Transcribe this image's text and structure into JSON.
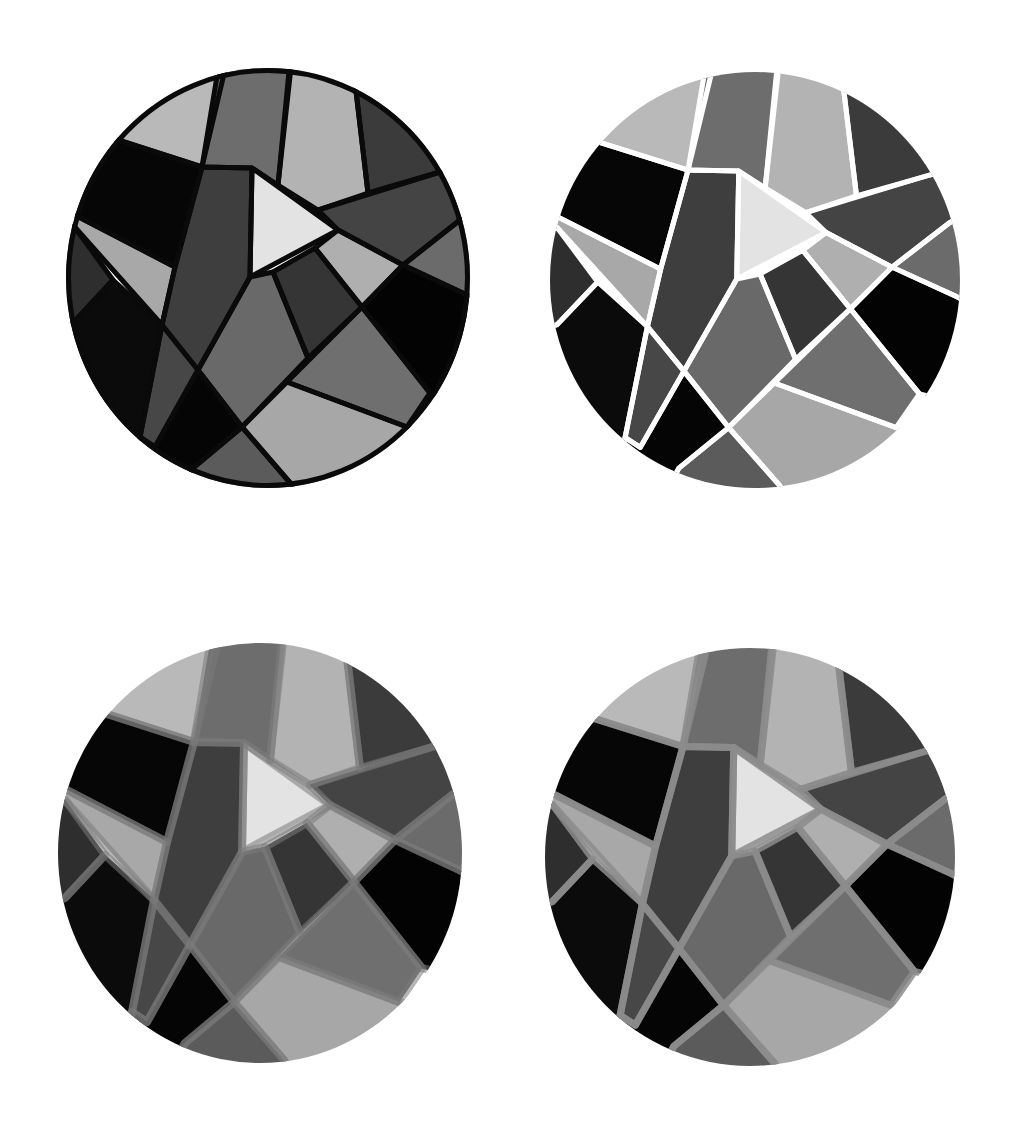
{
  "figure": {
    "source_box": {
      "x": 60,
      "y": 60,
      "w": 420,
      "h": 440
    },
    "clip_ellipse": {
      "cx": 268,
      "cy": 278,
      "rx": 202,
      "ry": 210
    },
    "pieces": [
      {
        "id": "top-left-light",
        "fill": "#b9b9b9",
        "points": "40,40 232,40 202,167 118,140 40,118"
      },
      {
        "id": "top-dark-strip",
        "fill": "#6d6d6d",
        "points": "223,40 294,40 278,185 252,168 202,167"
      },
      {
        "id": "top-light-strip",
        "fill": "#b3b3b3",
        "points": "292,40 350,40 368,193 318,210 278,185"
      },
      {
        "id": "top-right-dark",
        "fill": "#3b3b3b",
        "points": "350,40 500,40 500,155 440,172 368,193"
      },
      {
        "id": "right-dark-band",
        "fill": "#444444",
        "points": "318,210 440,172 500,155 500,195 460,220 403,265 338,230"
      },
      {
        "id": "right-small-medium",
        "fill": "#6b6b6b",
        "points": "460,220 500,195 500,312 467,295 403,265"
      },
      {
        "id": "left-black",
        "fill": "#060606",
        "points": "40,118 118,140 202,167 175,267 75,215 40,200"
      },
      {
        "id": "left-light-stripe",
        "fill": "#a8a8a8",
        "points": "40,200 75,215 175,267 162,325 73,225 40,214"
      },
      {
        "id": "left-very-dark",
        "fill": "#2e2e2e",
        "points": "40,214 73,225 113,280 73,323 40,335"
      },
      {
        "id": "lower-left-black",
        "fill": "#0b0b0b",
        "points": "113,280 162,325 140,437 120,520 40,520 40,335 73,323"
      },
      {
        "id": "central-dark-band",
        "fill": "#3e3e3e",
        "points": "202,167 252,168 250,277 198,370 162,325 175,267"
      },
      {
        "id": "lower-dark-sliver",
        "fill": "#474747",
        "points": "162,325 198,370 155,447 140,437"
      },
      {
        "id": "bottom-black",
        "fill": "#050505",
        "points": "198,370 242,427 193,468 165,520 120,520 140,437 155,447"
      },
      {
        "id": "bottom-medium",
        "fill": "#5b5b5b",
        "points": "242,427 292,485 310,520 165,520 193,468"
      },
      {
        "id": "center-medium",
        "fill": "#696969",
        "points": "250,277 273,272 308,358 242,427 198,370"
      },
      {
        "id": "center-dark",
        "fill": "#353535",
        "points": "273,272 315,248 362,307 308,358"
      },
      {
        "id": "right-light-small",
        "fill": "#afafaf",
        "points": "315,248 338,230 403,265 362,307"
      },
      {
        "id": "right-black",
        "fill": "#030303",
        "points": "362,307 403,265 467,295 500,312 500,410 430,393"
      },
      {
        "id": "lower-right-medium",
        "fill": "#6f6f6f",
        "points": "287,382 362,307 430,393 407,427"
      },
      {
        "id": "bottom-light",
        "fill": "#a7a7a7",
        "points": "242,427 287,382 407,427 500,450 500,520 310,520 292,485"
      },
      {
        "id": "play-triangle",
        "fill": "#e3e3e3",
        "points": "252,168 338,230 250,277"
      }
    ]
  },
  "variants": [
    {
      "name": "black-outline-variant",
      "box": {
        "x": 66,
        "y": 68,
        "w": 404,
        "h": 420
      },
      "separator_color": "#0a0a0a",
      "separator_width": 5,
      "separator_opacity": 1,
      "outline_color": "#0a0a0a",
      "outline_width": 5
    },
    {
      "name": "white-separator-variant",
      "box": {
        "x": 550,
        "y": 72,
        "w": 410,
        "h": 416
      },
      "separator_color": "#ffffff",
      "separator_width": 5,
      "separator_opacity": 1,
      "outline_color": "none",
      "outline_width": 0
    },
    {
      "name": "soft-gray-inset-variant",
      "box": {
        "x": 58,
        "y": 643,
        "w": 404,
        "h": 420
      },
      "separator_color": "#7a7a7a",
      "separator_width": 8,
      "separator_opacity": 0.55,
      "outline_color": "none",
      "outline_width": 0
    },
    {
      "name": "gray-border-variant",
      "box": {
        "x": 545,
        "y": 648,
        "w": 410,
        "h": 418
      },
      "separator_color": "#8c8c8c",
      "separator_width": 7,
      "separator_opacity": 0.85,
      "outline_color": "none",
      "outline_width": 0
    }
  ]
}
